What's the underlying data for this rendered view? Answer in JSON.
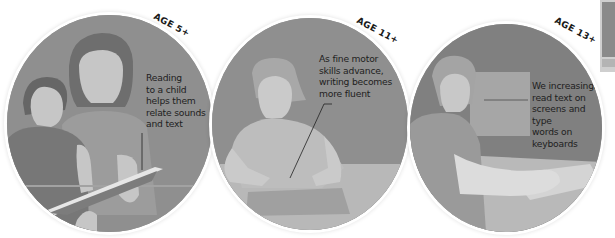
{
  "panels": [
    {
      "age_label": "AGE 5+",
      "caption": "Reading\nto a child\nhelps them\nrelate sounds\nand text",
      "scene": "adult-reading-book-to-child"
    },
    {
      "age_label": "AGE 11+",
      "caption": "As fine motor\nskills advance,\nwriting becomes\nmore fluent",
      "scene": "child-writing-at-desk"
    },
    {
      "age_label": "AGE 13+",
      "caption": "We increasingly\nread text on\nscreens and type\nwords on\nkeyboards",
      "scene": "person-typing-at-computer"
    }
  ],
  "colors": {
    "background": "#ffffff",
    "panel_dark": "#8e8e8e",
    "figure_light": "#c8c8c8",
    "figure_mid": "#a6a6a6",
    "text": "#1e1e1e"
  }
}
